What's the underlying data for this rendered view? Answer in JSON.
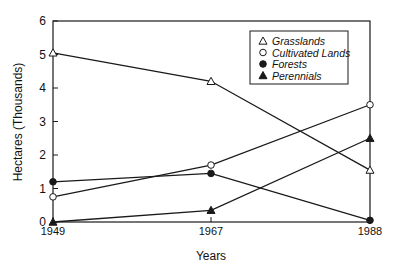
{
  "chart_data": {
    "type": "line",
    "title": "",
    "xlabel": "Years",
    "ylabel": "Hectares (Thousands)",
    "x": [
      1949,
      1967,
      1988
    ],
    "x_tick_labels": [
      "1949",
      "1967",
      "1988"
    ],
    "y_tick_labels": [
      "0",
      "1",
      "2",
      "3",
      "4",
      "5",
      "6"
    ],
    "ylim": [
      0,
      6
    ],
    "grid": false,
    "legend_position": "upper right (inside plot)",
    "series": [
      {
        "name": "Grasslands",
        "marker": "open-triangle",
        "values": [
          5.05,
          4.2,
          1.55
        ]
      },
      {
        "name": "Cultivated Lands",
        "marker": "open-circle",
        "values": [
          0.75,
          1.7,
          3.5
        ]
      },
      {
        "name": "Forests",
        "marker": "filled-circle",
        "values": [
          1.2,
          1.45,
          0.05
        ]
      },
      {
        "name": "Perennials",
        "marker": "filled-triangle",
        "values": [
          0.0,
          0.35,
          2.5
        ]
      }
    ]
  },
  "colors": {
    "ink": "#1a1a1a",
    "background": "#ffffff"
  }
}
